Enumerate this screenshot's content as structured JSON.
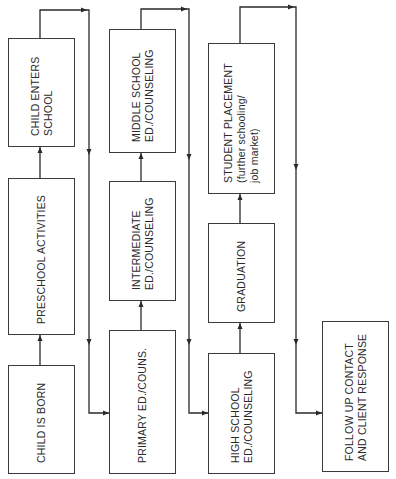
{
  "diagram": {
    "type": "flowchart",
    "orientation": "rotated-90-ccw",
    "columns": [
      {
        "boxes": [
          {
            "id": "child-is-born",
            "lines": [
              "CHILD IS BORN"
            ],
            "x": 8,
            "y": 365,
            "w": 66,
            "h": 108
          },
          {
            "id": "preschool-activities",
            "lines": [
              "PRESCHOOL ACTIVITIES"
            ],
            "x": 8,
            "y": 178,
            "w": 66,
            "h": 156
          },
          {
            "id": "child-enters-school",
            "lines": [
              "CHILD ENTERS",
              "SCHOOL"
            ],
            "x": 8,
            "y": 38,
            "w": 66,
            "h": 108
          }
        ]
      },
      {
        "boxes": [
          {
            "id": "primary-ed-couns",
            "lines": [
              "PRIMARY ED./COUNS."
            ],
            "x": 109,
            "y": 330,
            "w": 66,
            "h": 143
          },
          {
            "id": "intermediate-ed-counseling",
            "lines": [
              "INTERMEDIATE",
              "ED./COUNSELING"
            ],
            "x": 109,
            "y": 181,
            "w": 66,
            "h": 119
          },
          {
            "id": "middle-school-ed-counseling",
            "lines": [
              "MIDDLE SCHOOL",
              "ED./COUNSELING"
            ],
            "x": 109,
            "y": 29,
            "w": 66,
            "h": 123
          }
        ]
      },
      {
        "boxes": [
          {
            "id": "high-school-ed-counseling",
            "lines": [
              "HIGH SCHOOL",
              "ED./COUNSELING"
            ],
            "x": 208,
            "y": 353,
            "w": 66,
            "h": 120
          },
          {
            "id": "graduation",
            "lines": [
              "GRADUATION"
            ],
            "x": 208,
            "y": 223,
            "w": 66,
            "h": 99
          },
          {
            "id": "student-placement",
            "lines": [
              "STUDENT PLACEMENT",
              "(further schooling/",
              "job market)"
            ],
            "x": 208,
            "y": 43,
            "w": 66,
            "h": 150
          }
        ]
      },
      {
        "boxes": [
          {
            "id": "follow-up-contact",
            "lines": [
              "FOLLOW UP CONTACT",
              "AND CLIENT RESPONSE"
            ],
            "x": 322,
            "y": 321,
            "w": 66,
            "h": 150
          }
        ]
      }
    ],
    "flow": [
      "CHILD IS BORN",
      "PRESCHOOL ACTIVITIES",
      "CHILD ENTERS SCHOOL",
      "PRIMARY ED./COUNS.",
      "INTERMEDIATE ED./COUNSELING",
      "MIDDLE SCHOOL ED./COUNSELING",
      "HIGH SCHOOL ED./COUNSELING",
      "GRADUATION",
      "STUDENT PLACEMENT (further schooling/ job market)",
      "FOLLOW UP CONTACT AND CLIENT RESPONSE"
    ],
    "colors": {
      "background": "#ffffff",
      "line": "#2a2a2a",
      "text": "#2a2a2a"
    }
  }
}
